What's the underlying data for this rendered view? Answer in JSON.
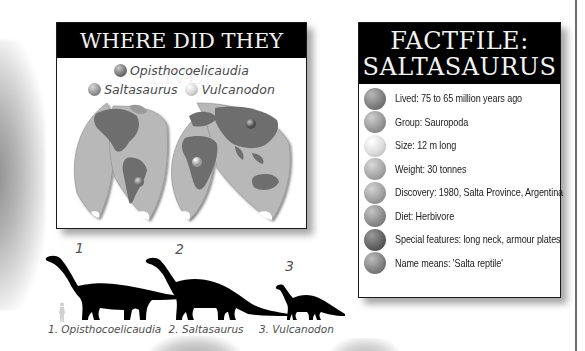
{
  "map_panel": {
    "title": "WHERE DID THEY LIVE?",
    "legend": [
      {
        "label": "Opisthocoelicaudia",
        "icon": "dark-grey-ball"
      },
      {
        "label": "Saltasaurus",
        "icon": "mid-grey-ball"
      },
      {
        "label": "Vulcanodon",
        "icon": "light-grey-ball"
      }
    ],
    "map_description": "World map (interrupted projection) with location markers in Asia, South America and Africa"
  },
  "factfile": {
    "title_line1": "FACTFILE:",
    "title_line2": "SALTASAURUS",
    "items": [
      {
        "text": "Lived: 75 to 65 million years ago"
      },
      {
        "text": "Group: Sauropoda"
      },
      {
        "text": "Size: 12 m long"
      },
      {
        "text": "Weight: 30 tonnes"
      },
      {
        "text": "Discovery: 1980, Salta Province, Argentina"
      },
      {
        "text": "Diet: Herbivore"
      },
      {
        "text": "Special features: long neck, armour plates"
      },
      {
        "text": "Name means: 'Salta reptile'"
      }
    ]
  },
  "size_comparison": {
    "numbers": [
      "1",
      "2",
      "3"
    ],
    "captions": [
      "1. Opisthocoelicaudia",
      "2. Saltasaurus",
      "3. Vulcanodon"
    ]
  }
}
